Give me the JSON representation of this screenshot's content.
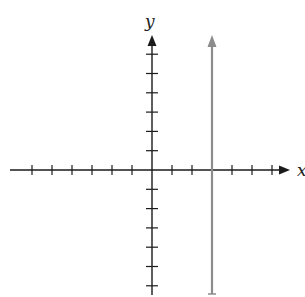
{
  "chart_data": {
    "type": "line",
    "title": "",
    "xlabel": "x",
    "ylabel": "y",
    "grid": false,
    "xlim": [
      -6,
      7
    ],
    "ylim": [
      -6,
      7
    ],
    "x_ticks": [
      -6,
      -5,
      -4,
      -3,
      -2,
      -1,
      1,
      2,
      3,
      4,
      5,
      6
    ],
    "y_ticks": [
      -6,
      -5,
      -4,
      -3,
      -2,
      -1,
      1,
      2,
      3,
      4,
      5,
      6
    ],
    "tick_labels_shown": false,
    "series": [
      {
        "name": "vertical line",
        "description": "vertical line x = 3, arrow upward, closed at bottom",
        "equation": "x = 3",
        "points": [
          [
            3,
            -6.5
          ],
          [
            3,
            7
          ]
        ],
        "color": "#8c8c8c",
        "arrow_top": true,
        "end_cap_bottom": true
      }
    ]
  },
  "labels": {
    "x_axis": "x",
    "y_axis": "y"
  },
  "colors": {
    "axis": "#1a1a1a",
    "line": "#8c8c8c"
  }
}
